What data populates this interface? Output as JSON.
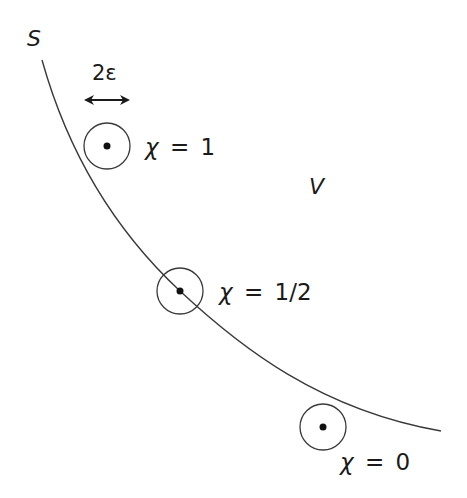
{
  "diagram": {
    "surface_label": "S",
    "region_label": "V",
    "width_label": "2ε",
    "colors": {
      "stroke": "#3a3a3a",
      "text": "#1a1a1a",
      "background": "#ffffff"
    },
    "points": [
      {
        "id": "inside",
        "label_var": "χ",
        "label_eq": "=",
        "label_val": "1",
        "cx": 107,
        "cy": 146,
        "r": 23
      },
      {
        "id": "on-surface",
        "label_var": "χ",
        "label_eq": "=",
        "label_val": "1/2",
        "cx": 180,
        "cy": 291,
        "r": 23
      },
      {
        "id": "outside",
        "label_var": "χ",
        "label_eq": "=",
        "label_val": "0",
        "cx": 323,
        "cy": 427,
        "r": 23
      }
    ]
  }
}
